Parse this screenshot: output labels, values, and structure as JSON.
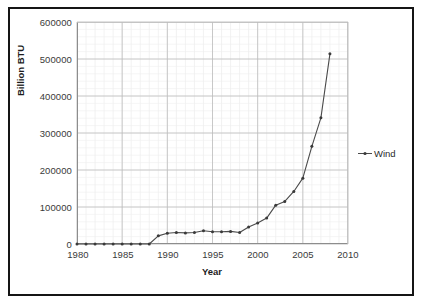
{
  "chart_data": {
    "type": "line",
    "title": "",
    "xlabel": "Year",
    "ylabel": "Billion BTU",
    "xlim": [
      1980,
      2010
    ],
    "ylim": [
      0,
      600000
    ],
    "xticks": [
      "1980",
      "1985",
      "1990",
      "1995",
      "2000",
      "2005",
      "2010"
    ],
    "xtick_values": [
      1980,
      1985,
      1990,
      1995,
      2000,
      2005,
      2010
    ],
    "yticks": [
      "0",
      "100000",
      "200000",
      "300000",
      "400000",
      "500000",
      "600000"
    ],
    "ytick_values": [
      0,
      100000,
      200000,
      300000,
      400000,
      500000,
      600000
    ],
    "grid": true,
    "minor_grid": true,
    "legend_position": "right",
    "series": [
      {
        "name": "Wind",
        "color": "#4a4a4a",
        "marker": "dot",
        "x": [
          1980,
          1981,
          1982,
          1983,
          1984,
          1985,
          1986,
          1987,
          1988,
          1989,
          1990,
          1991,
          1992,
          1993,
          1994,
          1995,
          1996,
          1997,
          1998,
          1999,
          2000,
          2001,
          2002,
          2003,
          2004,
          2005,
          2006,
          2007,
          2008
        ],
        "values": [
          0,
          0,
          0,
          0,
          0,
          0,
          0,
          0,
          0,
          22000,
          29000,
          31000,
          30000,
          31000,
          36000,
          33000,
          33000,
          34000,
          31000,
          46000,
          57000,
          70000,
          105000,
          115000,
          142000,
          178000,
          264000,
          341000,
          514000
        ]
      }
    ]
  },
  "legend": {
    "entries": [
      {
        "label": "Wind"
      }
    ]
  },
  "axes": {
    "x_title": "Year",
    "y_title": "Billion BTU"
  }
}
